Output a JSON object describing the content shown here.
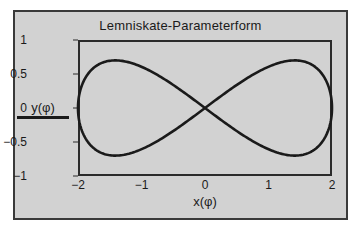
{
  "figure": {
    "background_color": "#d2d2d2",
    "border_color": "#3a3a3a",
    "page_background": "#ffffff"
  },
  "chart_data": {
    "type": "line",
    "title": "Lemniskate-Parameterform",
    "xlabel": "x(φ)",
    "ylabel": "y(φ)",
    "xlim": [
      -2,
      2
    ],
    "ylim": [
      -1,
      1
    ],
    "xticks": [
      -2,
      -1,
      0,
      1,
      2
    ],
    "xticklabels": [
      "−2",
      "−1",
      "0",
      "1",
      "2"
    ],
    "yticks": [
      1,
      0.5,
      0,
      -0.5,
      -1
    ],
    "yticklabels": [
      "1",
      "0.5",
      "0",
      "−0.5",
      "−1"
    ],
    "grid": false,
    "legend": null,
    "line_color": "#1a1a1a",
    "line_width": 2.6,
    "parametric": {
      "x_expr": "2*sin(phi)",
      "y_expr": "0.7*sin(2*phi)",
      "phi_range": [
        0,
        6.283185307179586
      ],
      "samples": 401
    },
    "annotations": [],
    "series": [
      {
        "name": "Lemniskate",
        "x": [
          0,
          0.313,
          0.618,
          0.908,
          1.176,
          1.414,
          1.618,
          1.782,
          1.902,
          1.975,
          2.0,
          1.975,
          1.902,
          1.782,
          1.618,
          1.414,
          1.176,
          0.908,
          0.618,
          0.313,
          0,
          -0.313,
          -0.618,
          -0.908,
          -1.176,
          -1.414,
          -1.618,
          -1.782,
          -1.902,
          -1.975,
          -2.0,
          -1.975,
          -1.902,
          -1.782,
          -1.618,
          -1.414,
          -1.176,
          -0.908,
          -0.618,
          -0.313,
          0
        ],
        "y": [
          0,
          0.216,
          0.411,
          0.566,
          0.666,
          0.7,
          0.666,
          0.566,
          0.411,
          0.216,
          0,
          -0.216,
          -0.411,
          -0.566,
          -0.666,
          -0.7,
          -0.666,
          -0.566,
          -0.411,
          -0.216,
          0,
          0.216,
          0.411,
          0.566,
          0.666,
          0.7,
          0.666,
          0.566,
          0.411,
          0.216,
          0,
          -0.216,
          -0.411,
          -0.566,
          -0.666,
          -0.7,
          -0.666,
          -0.566,
          -0.411,
          -0.216,
          0
        ]
      }
    ]
  }
}
